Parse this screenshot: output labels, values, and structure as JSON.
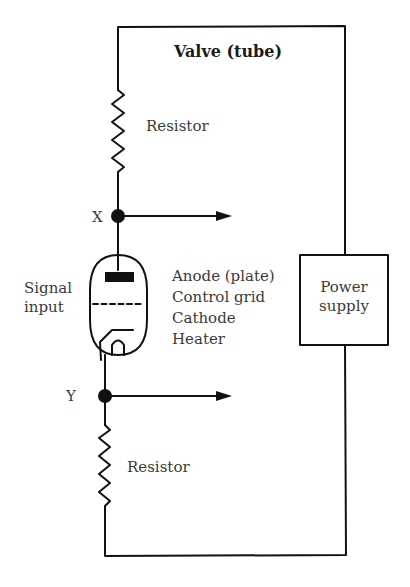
{
  "diagram": {
    "title": "Valve (tube)",
    "labels": {
      "resistor_top": "Resistor",
      "resistor_bottom": "Resistor",
      "node_x": "X",
      "node_y": "Y",
      "signal_input_line1": "Signal",
      "signal_input_line2": "input",
      "power_supply_line1": "Power",
      "power_supply_line2": "supply"
    },
    "tube_parts": [
      {
        "label": "Anode (plate)"
      },
      {
        "label": "Control grid"
      },
      {
        "label": "Cathode"
      },
      {
        "label": "Heater"
      }
    ],
    "colors": {
      "line": "#111111",
      "text": "#3a3a3a",
      "background": "#ffffff"
    }
  }
}
